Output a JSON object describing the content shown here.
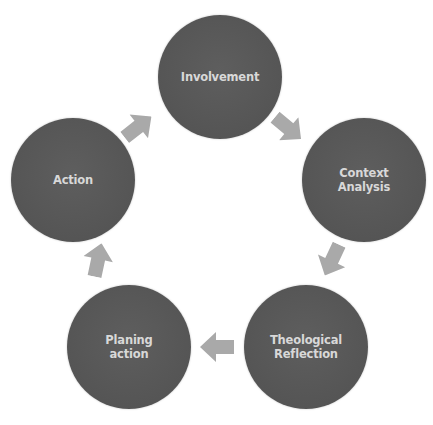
{
  "diagram": {
    "type": "cycle",
    "colors": {
      "node_fill": "#575757",
      "node_text": "#d8d8d8",
      "arrow_fill": "#a9a9a9",
      "background": "#ffffff"
    },
    "nodes": [
      {
        "id": "involvement",
        "label": "Involvement"
      },
      {
        "id": "context-analysis",
        "label": "Context\nAnalysis"
      },
      {
        "id": "theological-reflection",
        "label": "Theological\nReflection"
      },
      {
        "id": "planing-action",
        "label": "Planing\naction"
      },
      {
        "id": "action",
        "label": "Action"
      }
    ],
    "edges": [
      {
        "from": "involvement",
        "to": "context-analysis"
      },
      {
        "from": "context-analysis",
        "to": "theological-reflection"
      },
      {
        "from": "theological-reflection",
        "to": "planing-action"
      },
      {
        "from": "planing-action",
        "to": "action"
      },
      {
        "from": "action",
        "to": "involvement"
      }
    ]
  }
}
